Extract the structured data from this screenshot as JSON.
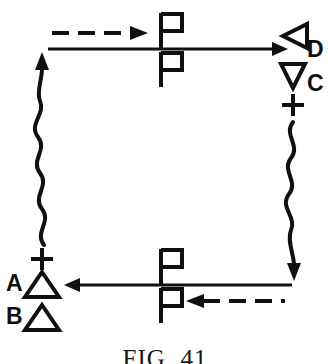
{
  "figure": {
    "caption": "FIG. 41",
    "background_color": "#ffffff",
    "ink_color": "#101010"
  },
  "nodes": [
    {
      "id": "A",
      "label": "A",
      "glyph": "up-triangle",
      "position": "bottom-left",
      "has_plus": true
    },
    {
      "id": "B",
      "label": "B",
      "glyph": "up-triangle",
      "position": "bottom-left-lower",
      "has_plus": false
    },
    {
      "id": "C",
      "label": "C",
      "glyph": "down-triangle",
      "position": "top-right-lower",
      "has_plus": true
    },
    {
      "id": "D",
      "label": "D",
      "glyph": "left-triangle",
      "position": "top-right",
      "has_plus": false
    }
  ],
  "edges": [
    {
      "id": "top-solid-arrow",
      "style": "solid",
      "direction": "right",
      "from": "left",
      "to": "D"
    },
    {
      "id": "top-dashed-arrow",
      "style": "dashed",
      "direction": "right",
      "dash_count": 4
    },
    {
      "id": "bottom-solid-arrow",
      "style": "solid",
      "direction": "left",
      "from": "right",
      "to": "A"
    },
    {
      "id": "bottom-dashed-arrow",
      "style": "dashed",
      "direction": "left",
      "dash_count": 4
    },
    {
      "id": "left-wavy-arrow",
      "style": "wavy",
      "direction": "up"
    },
    {
      "id": "right-wavy-arrow",
      "style": "wavy",
      "direction": "down"
    }
  ],
  "flag_markers": [
    {
      "id": "top-flag-above",
      "position": "top-center-above-line"
    },
    {
      "id": "top-flag-below",
      "position": "top-center-below-line"
    },
    {
      "id": "bottom-flag-above",
      "position": "bottom-center-above-line"
    },
    {
      "id": "bottom-flag-below",
      "position": "bottom-center-below-line"
    }
  ],
  "plus_signs": [
    {
      "id": "left-plus",
      "near": "A"
    },
    {
      "id": "right-plus",
      "near": "C"
    }
  ]
}
